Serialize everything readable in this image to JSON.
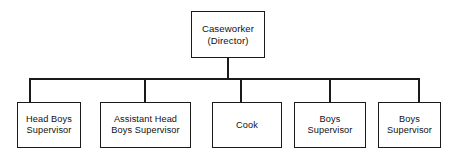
{
  "chart_data": {
    "type": "diagram",
    "diagram_type": "organizational-chart",
    "title": "",
    "orientation": "top-down",
    "root": {
      "id": "caseworker-director",
      "label": "Caseworker\n(Director)",
      "lines": [
        "Caseworker",
        "(Director)"
      ]
    },
    "children": [
      {
        "id": "head-boys-supervisor",
        "label": "Head Boys\nSupervisor",
        "lines": [
          "Head Boys",
          "Supervisor"
        ]
      },
      {
        "id": "assistant-head-boys-supervisor",
        "label": "Assistant Head\nBoys Supervisor",
        "lines": [
          "Assistant Head",
          "Boys Supervisor"
        ]
      },
      {
        "id": "cook",
        "label": "Cook",
        "lines": [
          "Cook"
        ]
      },
      {
        "id": "boys-supervisor-1",
        "label": "Boys\nSupervisor",
        "lines": [
          "Boys",
          "Supervisor"
        ]
      },
      {
        "id": "boys-supervisor-2",
        "label": "Boys\nSupervisor",
        "lines": [
          "Boys",
          "Supervisor"
        ]
      }
    ],
    "edges": [
      {
        "from": "caseworker-director",
        "to": "head-boys-supervisor"
      },
      {
        "from": "caseworker-director",
        "to": "assistant-head-boys-supervisor"
      },
      {
        "from": "caseworker-director",
        "to": "cook"
      },
      {
        "from": "caseworker-director",
        "to": "boys-supervisor-1"
      },
      {
        "from": "caseworker-director",
        "to": "boys-supervisor-2"
      }
    ],
    "colors": {
      "background": "#ffffff",
      "box_border": "#1a1a1a",
      "box_fill": "#ffffff",
      "connector": "#1a1a1a",
      "text": "#111111"
    },
    "node_count": 6,
    "levels": 2
  }
}
